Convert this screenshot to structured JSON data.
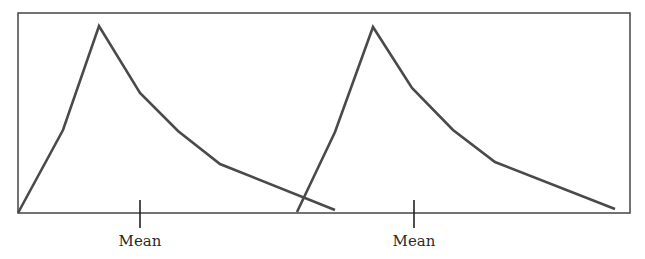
{
  "figure": {
    "colors": {
      "frame": "#444444",
      "curve": "#4a4a4a",
      "tick": "#222222",
      "background": "#ffffff"
    }
  },
  "chart_data": {
    "type": "line",
    "title": "",
    "xlabel": "",
    "ylabel": "",
    "grid": false,
    "legend": null,
    "series": [
      {
        "name": "distribution-1",
        "points_px": [
          [
            18,
            213
          ],
          [
            63,
            130
          ],
          [
            99,
            26
          ],
          [
            140,
            93
          ],
          [
            178,
            131
          ],
          [
            220,
            164
          ],
          [
            335,
            210
          ]
        ]
      },
      {
        "name": "distribution-2",
        "points_px": [
          [
            297,
            212
          ],
          [
            335,
            132
          ],
          [
            373,
            27
          ],
          [
            412,
            88
          ],
          [
            453,
            130
          ],
          [
            495,
            162
          ],
          [
            615,
            209
          ]
        ]
      }
    ],
    "annotations": [
      {
        "text": "Mean",
        "x_px": 140,
        "series": "distribution-1"
      },
      {
        "text": "Mean",
        "x_px": 414,
        "series": "distribution-2"
      }
    ]
  },
  "labels": {
    "mean_left": "Mean",
    "mean_right": "Mean"
  }
}
